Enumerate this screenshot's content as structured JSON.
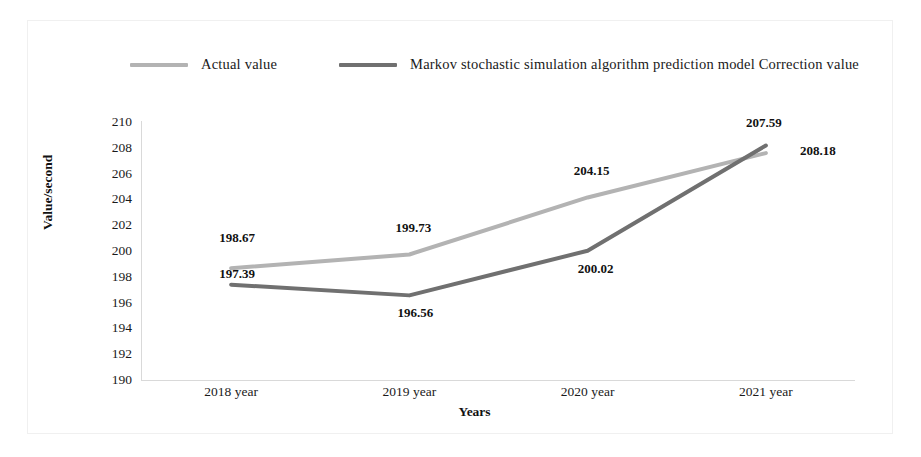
{
  "chart_data": {
    "type": "line",
    "title": "",
    "xlabel": "Years",
    "ylabel": "Value/second",
    "categories": [
      "2018 year",
      "2019 year",
      "2020 year",
      "2021 year"
    ],
    "ylim": [
      190,
      210
    ],
    "ytick_step": 2,
    "yticks": [
      "210",
      "208",
      "206",
      "204",
      "202",
      "200",
      "198",
      "196",
      "194",
      "192",
      "190"
    ],
    "grid": false,
    "legend_position": "top",
    "series": [
      {
        "name": "Actual value",
        "color": "#b3b3b3",
        "values": [
          198.67,
          199.73,
          204.15,
          207.59
        ],
        "labels": [
          "198.67",
          "199.73",
          "204.15",
          "207.59"
        ]
      },
      {
        "name": "Markov stochastic simulation algorithm prediction model  Correction value",
        "color": "#707070",
        "values": [
          197.39,
          196.56,
          200.02,
          208.18
        ],
        "labels": [
          "197.39",
          "196.56",
          "200.02",
          "208.18"
        ]
      }
    ]
  },
  "legend": {
    "entries": [
      {
        "label": "Actual value"
      },
      {
        "label": "Markov stochastic simulation algorithm prediction model  Correction value"
      }
    ]
  },
  "axes": {
    "y_title": "Value/second",
    "x_title": "Years"
  },
  "colors": {
    "actual": "#b3b3b3",
    "correction": "#707070",
    "axis": "#d9d9d9",
    "text": "#1a1a1a"
  }
}
